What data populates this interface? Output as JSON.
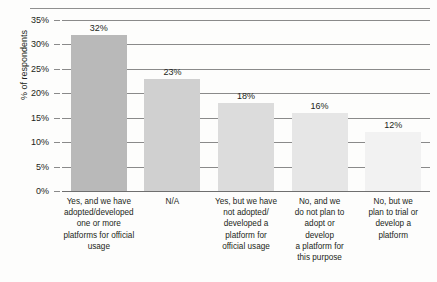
{
  "figure": {
    "title_remnant": "",
    "y_axis_title": "% of respondents"
  },
  "chart_data": {
    "type": "bar",
    "title": "",
    "xlabel": "",
    "ylabel": "% of respondents",
    "ylim": [
      0,
      35
    ],
    "ytick_labels": [
      "35%",
      "30%",
      "25%",
      "20%",
      "15%",
      "10%",
      "5%",
      "0%"
    ],
    "ytick_values": [
      35,
      30,
      25,
      20,
      15,
      10,
      5,
      0
    ],
    "grid": true,
    "legend": "none",
    "orientation": "vertical",
    "categories": [
      "Yes, and we have adopted/developed one or more platforms for official usage",
      "N/A",
      "Yes, but we have not adopted/developed a platform for official usage",
      "No, and we do not plan to adopt or develop a platform for this purpose",
      "No, but we plan to trial or develop a platform"
    ],
    "category_lines": [
      [
        "Yes, and we have",
        "adopted/developed",
        "one or more",
        "platforms for official",
        "usage"
      ],
      [
        "N/A"
      ],
      [
        "Yes, but we have",
        "not adopted/",
        "developed a",
        "platform for",
        "official usage"
      ],
      [
        "No, and we",
        "do not plan to",
        "adopt or",
        "develop",
        "a platform for",
        "this purpose"
      ],
      [
        "No, but we",
        "plan to trial or",
        "develop a",
        "platform"
      ]
    ],
    "values": [
      32,
      23,
      18,
      16,
      12
    ],
    "value_labels": [
      "32%",
      "23%",
      "18%",
      "16%",
      "12%"
    ],
    "bar_colors": [
      "#b9b9b9",
      "#d0d0d0",
      "#dcdcdc",
      "#e6e6e6",
      "#f2f2f2"
    ]
  },
  "colors": {
    "gridline": "#8a8a8a",
    "axis_rule": "#8f8f8f",
    "text": "#231f20",
    "background": "#fdfdfc"
  }
}
